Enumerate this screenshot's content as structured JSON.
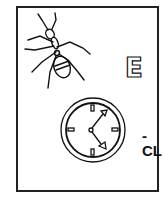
{
  "card": {
    "letter": "E",
    "suffix": "-CL",
    "pictures": [
      {
        "name": "ant",
        "icon": "ant-icon"
      },
      {
        "name": "clock",
        "icon": "clock-icon",
        "time": "about 12:25 / 4:05 style hands"
      }
    ]
  }
}
